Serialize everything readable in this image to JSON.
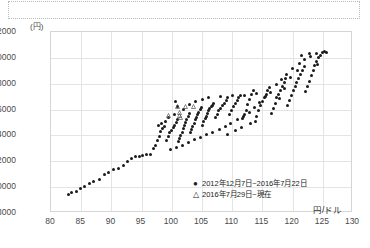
{
  "top_note_box": {
    "text": ""
  },
  "chart_data": {
    "type": "scatter",
    "title": "",
    "xlabel": "円/ドル",
    "ylabel": "(円)",
    "xlim": [
      80,
      130
    ],
    "ylim": [
      8000,
      22000
    ],
    "xticks": [
      80,
      85,
      90,
      95,
      100,
      105,
      110,
      115,
      120,
      125,
      130
    ],
    "yticks": [
      8000,
      10000,
      12000,
      14000,
      16000,
      18000,
      20000,
      22000
    ],
    "grid": true,
    "legend_position": "inside-bottom-right",
    "series": [
      {
        "name": "2012年12月7日~2016年7月22日",
        "marker": "filled-circle",
        "color": "#1a1a1a",
        "points": [
          [
            82.9,
            9450
          ],
          [
            83.4,
            9550
          ],
          [
            84.2,
            9700
          ],
          [
            84.9,
            9900
          ],
          [
            85.5,
            10050
          ],
          [
            86.3,
            10300
          ],
          [
            87.1,
            10450
          ],
          [
            88.0,
            10600
          ],
          [
            88.8,
            11000
          ],
          [
            89.6,
            11150
          ],
          [
            90.4,
            11350
          ],
          [
            91.2,
            11450
          ],
          [
            92.0,
            11700
          ],
          [
            92.6,
            12000
          ],
          [
            93.3,
            12250
          ],
          [
            94.0,
            12350
          ],
          [
            94.6,
            12400
          ],
          [
            95.2,
            12450
          ],
          [
            95.8,
            12500
          ],
          [
            96.4,
            12550
          ],
          [
            96.9,
            13000
          ],
          [
            97.3,
            13250
          ],
          [
            97.6,
            13600
          ],
          [
            97.9,
            13900
          ],
          [
            98.2,
            14300
          ],
          [
            98.5,
            14550
          ],
          [
            98.8,
            14700
          ],
          [
            99.1,
            13600
          ],
          [
            99.4,
            13900
          ],
          [
            99.7,
            14200
          ],
          [
            100.0,
            14400
          ],
          [
            100.2,
            14600
          ],
          [
            100.5,
            14800
          ],
          [
            100.7,
            15000
          ],
          [
            100.9,
            15200
          ],
          [
            101.1,
            13500
          ],
          [
            101.3,
            13750
          ],
          [
            101.5,
            14000
          ],
          [
            101.7,
            14250
          ],
          [
            101.9,
            14500
          ],
          [
            102.1,
            14750
          ],
          [
            102.3,
            15000
          ],
          [
            102.5,
            15250
          ],
          [
            102.7,
            15500
          ],
          [
            102.9,
            15700
          ],
          [
            103.1,
            14200
          ],
          [
            103.3,
            14450
          ],
          [
            103.5,
            14700
          ],
          [
            103.7,
            14950
          ],
          [
            103.9,
            15200
          ],
          [
            104.1,
            15400
          ],
          [
            104.3,
            15600
          ],
          [
            104.5,
            15800
          ],
          [
            104.7,
            16000
          ],
          [
            104.9,
            16150
          ],
          [
            105.1,
            14800
          ],
          [
            105.3,
            15050
          ],
          [
            105.5,
            15300
          ],
          [
            105.7,
            15500
          ],
          [
            105.9,
            15700
          ],
          [
            106.1,
            15900
          ],
          [
            106.3,
            16050
          ],
          [
            106.5,
            16200
          ],
          [
            106.7,
            16350
          ],
          [
            106.9,
            16500
          ],
          [
            107.2,
            15400
          ],
          [
            107.5,
            15650
          ],
          [
            107.8,
            15900
          ],
          [
            108.1,
            16100
          ],
          [
            108.4,
            16300
          ],
          [
            108.7,
            16500
          ],
          [
            109.0,
            16700
          ],
          [
            109.3,
            16900
          ],
          [
            109.6,
            15600
          ],
          [
            109.9,
            15900
          ],
          [
            110.2,
            16200
          ],
          [
            110.5,
            16450
          ],
          [
            110.8,
            16700
          ],
          [
            111.1,
            16900
          ],
          [
            111.4,
            17100
          ],
          [
            111.7,
            15300
          ],
          [
            112.0,
            15600
          ],
          [
            112.3,
            15950
          ],
          [
            112.6,
            16400
          ],
          [
            112.9,
            16800
          ],
          [
            113.2,
            17200
          ],
          [
            113.5,
            17500
          ],
          [
            113.8,
            15100
          ],
          [
            114.1,
            15500
          ],
          [
            114.4,
            15900
          ],
          [
            114.7,
            16300
          ],
          [
            115.0,
            16600
          ],
          [
            115.3,
            16900
          ],
          [
            115.6,
            17200
          ],
          [
            115.9,
            17450
          ],
          [
            116.2,
            17700
          ],
          [
            116.5,
            15700
          ],
          [
            116.8,
            16100
          ],
          [
            117.1,
            16500
          ],
          [
            117.4,
            16900
          ],
          [
            117.7,
            17200
          ],
          [
            118.0,
            17500
          ],
          [
            118.3,
            17800
          ],
          [
            118.6,
            18100
          ],
          [
            118.9,
            18400
          ],
          [
            119.2,
            16300
          ],
          [
            119.5,
            16700
          ],
          [
            119.8,
            17100
          ],
          [
            120.1,
            17500
          ],
          [
            120.4,
            17800
          ],
          [
            120.7,
            18100
          ],
          [
            121.0,
            18400
          ],
          [
            121.3,
            18700
          ],
          [
            121.6,
            19000
          ],
          [
            121.9,
            19300
          ],
          [
            122.2,
            17400
          ],
          [
            122.5,
            17800
          ],
          [
            122.8,
            18200
          ],
          [
            123.1,
            18600
          ],
          [
            123.4,
            19000
          ],
          [
            123.7,
            19400
          ],
          [
            124.0,
            19700
          ],
          [
            124.3,
            20000
          ],
          [
            124.6,
            20200
          ],
          [
            124.9,
            20400
          ],
          [
            125.2,
            20500
          ],
          [
            125.6,
            20450
          ],
          [
            123.0,
            20100
          ],
          [
            122.0,
            19900
          ],
          [
            121.2,
            19600
          ],
          [
            120.0,
            19200
          ],
          [
            119.0,
            18700
          ],
          [
            118.2,
            18300
          ],
          [
            117.3,
            17950
          ],
          [
            116.4,
            17350
          ],
          [
            115.5,
            17000
          ],
          [
            114.6,
            16550
          ],
          [
            113.7,
            16150
          ],
          [
            112.8,
            15750
          ],
          [
            111.9,
            15450
          ],
          [
            110.9,
            15200
          ],
          [
            109.8,
            14950
          ],
          [
            108.9,
            14700
          ],
          [
            107.9,
            14450
          ],
          [
            106.8,
            14250
          ],
          [
            105.8,
            14050
          ],
          [
            104.8,
            13850
          ],
          [
            103.8,
            13650
          ],
          [
            102.8,
            13450
          ],
          [
            101.8,
            13250
          ],
          [
            100.8,
            13050
          ],
          [
            99.8,
            12900
          ],
          [
            103.0,
            16400
          ],
          [
            104.0,
            16650
          ],
          [
            105.0,
            16800
          ],
          [
            106.0,
            16900
          ],
          [
            108.0,
            17000
          ],
          [
            110.0,
            17050
          ],
          [
            112.0,
            17100
          ],
          [
            114.0,
            17250
          ],
          [
            109.2,
            14100
          ],
          [
            110.6,
            14350
          ],
          [
            111.5,
            14600
          ],
          [
            113.0,
            14900
          ],
          [
            101.0,
            16200
          ],
          [
            102.0,
            16000
          ],
          [
            100.4,
            15600
          ],
          [
            99.5,
            15400
          ],
          [
            98.9,
            15100
          ],
          [
            98.3,
            14900
          ],
          [
            97.8,
            14800
          ],
          [
            100.6,
            16600
          ],
          [
            121.5,
            20150
          ],
          [
            122.8,
            20300
          ],
          [
            123.9,
            20350
          ],
          [
            124.2,
            19500
          ],
          [
            120.8,
            19050
          ],
          [
            119.6,
            18500
          ],
          [
            118.7,
            17600
          ],
          [
            117.8,
            16850
          ]
        ]
      },
      {
        "name": "2016年7月29日~現在",
        "marker": "open-triangle",
        "color": "#555555",
        "points": [
          [
            99.5,
            16250
          ],
          [
            101.0,
            16900
          ],
          [
            101.2,
            16500
          ],
          [
            101.3,
            16250
          ],
          [
            101.4,
            16100
          ],
          [
            102.3,
            16950
          ],
          [
            103.6,
            16900
          ]
        ]
      }
    ]
  },
  "legend": {
    "entries": [
      {
        "marker_glyph": "●",
        "label": "2012年12月7日~2016年7月22日"
      },
      {
        "marker_glyph": "△",
        "label": "2016年7月29日~現在"
      }
    ]
  }
}
